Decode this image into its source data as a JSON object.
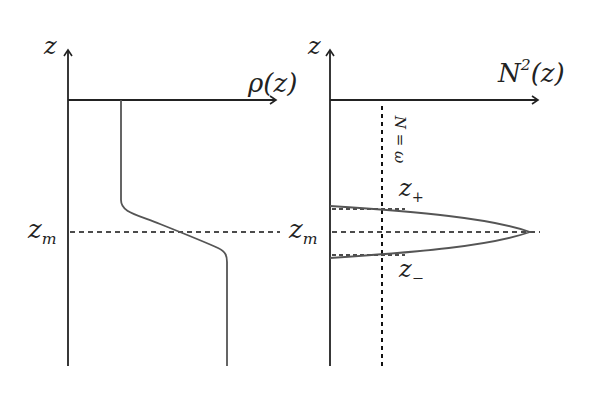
{
  "figure": {
    "left_panel": {
      "vertical_axis_label": "z",
      "horizontal_axis_label": "ρ(z)",
      "reference_line_label": "z",
      "reference_line_sub": "m",
      "curve": "density profile: constant, smooth step increase around z_m, constant"
    },
    "right_panel": {
      "vertical_axis_label": "z",
      "horizontal_axis_label_base": "N",
      "horizontal_axis_label_sup": "2",
      "horizontal_axis_label_arg": "(z)",
      "reference_line_label": "z",
      "reference_line_sub": "m",
      "upper_level_label": "z",
      "upper_level_sub": "+",
      "lower_level_label": "z",
      "lower_level_sub": "−",
      "frequency_line_label": "N = ω",
      "curve": "buoyancy frequency peak centered at z_m"
    },
    "colors": {
      "axis": "#222222",
      "curve": "#555555",
      "dashed": "#111111"
    }
  }
}
